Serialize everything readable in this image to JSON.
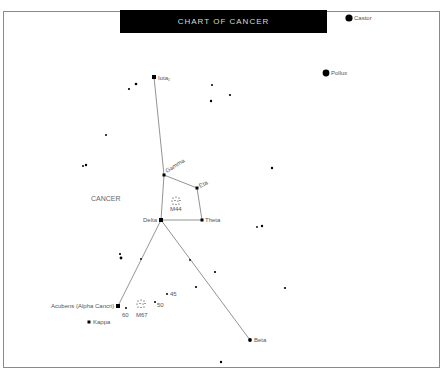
{
  "title": "CHART OF CANCER",
  "constellation_label": "CANCER",
  "colors": {
    "background": "#ffffff",
    "title_bg": "#000000",
    "title_text": "#d8d8d8",
    "star": "#000000",
    "line": "#777777",
    "label": "#555555",
    "frame": "#8a8a8a"
  },
  "named_stars": [
    {
      "id": "castor",
      "label": "Castor",
      "x": 349,
      "y": 18,
      "r": 3.6
    },
    {
      "id": "pollux",
      "label": "Pollux",
      "x": 326,
      "y": 73,
      "r": 3.4
    },
    {
      "id": "iota1",
      "label": "Iota₁",
      "x": 154,
      "y": 77,
      "r": 1.9
    },
    {
      "id": "gamma",
      "label": "Gamma",
      "x": 164,
      "y": 175,
      "r": 1.7
    },
    {
      "id": "eta",
      "label": "Eta",
      "x": 197,
      "y": 188,
      "r": 1.6
    },
    {
      "id": "delta",
      "label": "Delta",
      "x": 161,
      "y": 220,
      "r": 2.0
    },
    {
      "id": "theta",
      "label": "Theta",
      "x": 202,
      "y": 220,
      "r": 1.6
    },
    {
      "id": "acubens",
      "label": "Acubens (Alpha Cancri)",
      "x": 118,
      "y": 306,
      "r": 1.9
    },
    {
      "id": "beta",
      "label": "Beta",
      "x": 250,
      "y": 340,
      "r": 1.9
    },
    {
      "id": "kappa",
      "label": "Kappa",
      "x": 89,
      "y": 322,
      "r": 1.6
    },
    {
      "id": "s60",
      "label": "60",
      "x": 126,
      "y": 308,
      "r": 1.1
    },
    {
      "id": "s50",
      "label": "50",
      "x": 155,
      "y": 302,
      "r": 1.1
    },
    {
      "id": "s45",
      "label": "45",
      "x": 167,
      "y": 294,
      "r": 1.1
    }
  ],
  "clusters": [
    {
      "id": "m44",
      "label": "M44",
      "x": 176,
      "y": 201
    },
    {
      "id": "m67",
      "label": "M67",
      "x": 141,
      "y": 304
    }
  ],
  "unnamed_stars": [
    {
      "x": 129,
      "y": 89
    },
    {
      "x": 137,
      "y": 84
    },
    {
      "x": 136,
      "y": 85
    },
    {
      "x": 212,
      "y": 85
    },
    {
      "x": 211,
      "y": 101
    },
    {
      "x": 230,
      "y": 95
    },
    {
      "x": 106,
      "y": 135
    },
    {
      "x": 83,
      "y": 166
    },
    {
      "x": 86,
      "y": 165
    },
    {
      "x": 272,
      "y": 168
    },
    {
      "x": 257,
      "y": 227
    },
    {
      "x": 262,
      "y": 226
    },
    {
      "x": 120,
      "y": 254
    },
    {
      "x": 121,
      "y": 258
    },
    {
      "x": 141,
      "y": 259
    },
    {
      "x": 190,
      "y": 260
    },
    {
      "x": 215,
      "y": 272
    },
    {
      "x": 196,
      "y": 287
    },
    {
      "x": 285,
      "y": 288
    },
    {
      "x": 221,
      "y": 362
    }
  ],
  "lines": [
    [
      "iota1",
      "gamma"
    ],
    [
      "gamma",
      "delta"
    ],
    [
      "gamma",
      "eta"
    ],
    [
      "eta",
      "theta"
    ],
    [
      "delta",
      "theta"
    ],
    [
      "delta",
      "acubens"
    ],
    [
      "delta",
      "beta"
    ]
  ]
}
